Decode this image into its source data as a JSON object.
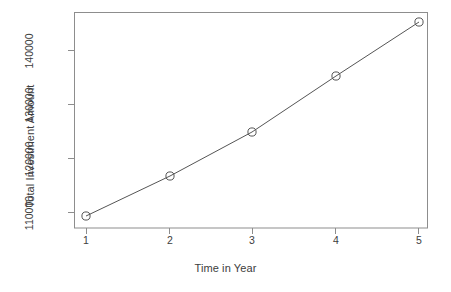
{
  "chart_data": {
    "type": "line",
    "title": "",
    "subtitle": "",
    "xlabel": "Time in Year",
    "ylabel": "Total Investment Amount",
    "x": [
      1,
      2,
      3,
      4,
      5
    ],
    "values": [
      109300,
      116700,
      125500,
      136000,
      146000
    ],
    "series": [
      {
        "name": "Total Investment Amount",
        "values": [
          109300,
          116700,
          125500,
          136000,
          146000
        ]
      }
    ],
    "x_tick_labels": [
      "1",
      "2",
      "3",
      "4",
      "5"
    ],
    "y_tick_labels": [
      "110000",
      "120000",
      "130000",
      "140000"
    ],
    "y_tick_values": [
      110000,
      120000,
      130000,
      140000
    ],
    "xlim": [
      0.84,
      5.16
    ],
    "ylim": [
      105000,
      149000
    ],
    "grid": false,
    "legend": false,
    "legend_position": "none",
    "marker": "open-circle",
    "line_color": "#555555",
    "marker_color": "#555555",
    "box_color": "#8a8a8a",
    "background": "#ffffff",
    "annotations": []
  },
  "axes": {
    "x_title": "Time in Year",
    "y_title": "Total Investment Amount"
  },
  "ticks": {
    "x": [
      {
        "label": "1",
        "px": 86
      },
      {
        "label": "2",
        "px": 170
      },
      {
        "label": "3",
        "px": 252
      },
      {
        "label": "4",
        "px": 336
      },
      {
        "label": "5",
        "px": 419
      }
    ],
    "y": [
      {
        "label": "110000",
        "px": 212
      },
      {
        "label": "120000",
        "px": 158
      },
      {
        "label": "130000",
        "px": 104
      },
      {
        "label": "140000",
        "px": 50
      }
    ]
  },
  "points": [
    {
      "x_px": 86,
      "y_px": 216,
      "value": 109300
    },
    {
      "x_px": 170,
      "y_px": 176,
      "value": 116700
    },
    {
      "x_px": 252,
      "y_px": 132,
      "value": 125500
    },
    {
      "x_px": 336,
      "y_px": 76,
      "value": 136000
    },
    {
      "x_px": 419,
      "y_px": 22,
      "value": 146000
    }
  ]
}
